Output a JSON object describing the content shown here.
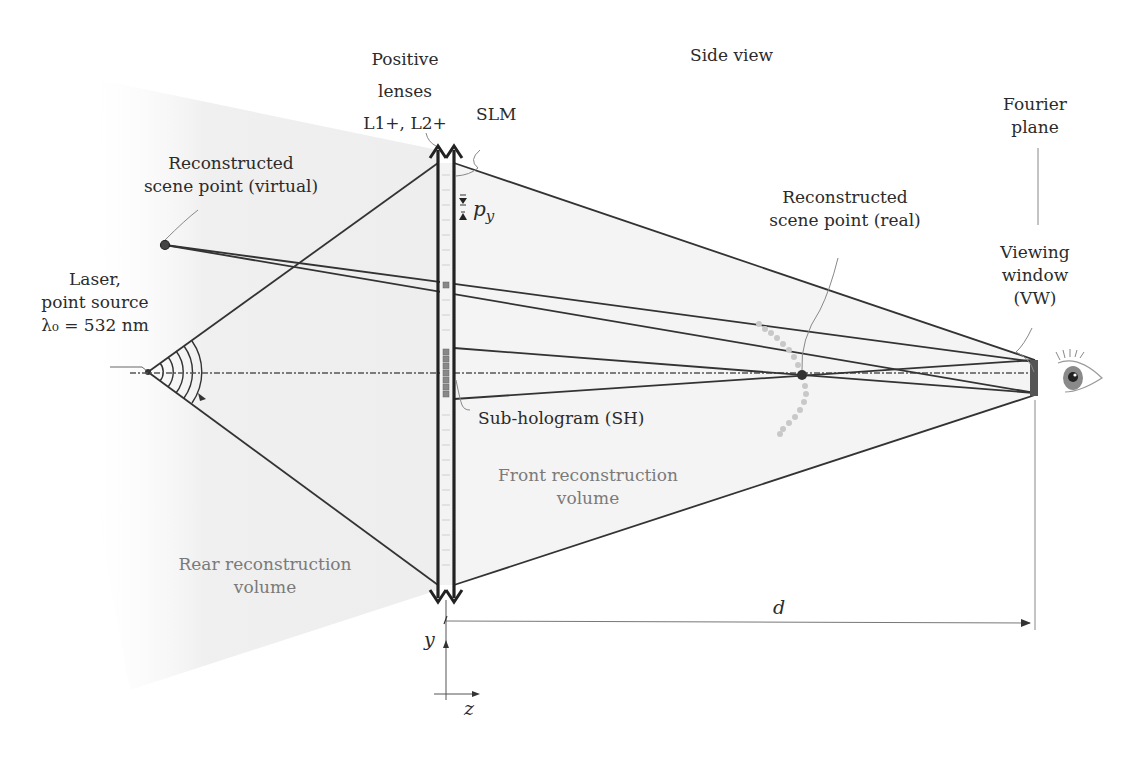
{
  "title": "Side view",
  "labels": {
    "positive_lenses": [
      "Positive",
      "lenses",
      "L1+, L2+"
    ],
    "slm": "SLM",
    "pixel_pitch": "p",
    "pixel_pitch_sub": "y",
    "virtual_point": [
      "Reconstructed",
      "scene point (virtual)"
    ],
    "laser": [
      "Laser,",
      "point source",
      "λ₀ = 532 nm"
    ],
    "real_point": [
      "Reconstructed",
      "scene point (real)"
    ],
    "fourier_plane": [
      "Fourier",
      "plane"
    ],
    "viewing_window": [
      "Viewing",
      "window",
      "(VW)"
    ],
    "sub_hologram": "Sub-hologram (SH)",
    "front_volume": [
      "Front reconstruction",
      "volume"
    ],
    "rear_volume": [
      "Rear reconstruction",
      "volume"
    ],
    "distance": "d",
    "axis_y": "y",
    "axis_z": "z"
  },
  "colors": {
    "line": "#333333",
    "shade": "#ededed",
    "scene_object": "#c8c8c8",
    "text": "#2b2b2b",
    "grey_text": "#7a7a7a"
  },
  "geometry": {
    "laser_source": [
      148,
      372
    ],
    "virtual_point": [
      165,
      245
    ],
    "real_point": [
      802,
      375
    ],
    "lens_x": 438,
    "slm_x": 454,
    "viewing_window_x": 1035,
    "optical_axis_y": 373,
    "wavelength_nm": 532
  }
}
